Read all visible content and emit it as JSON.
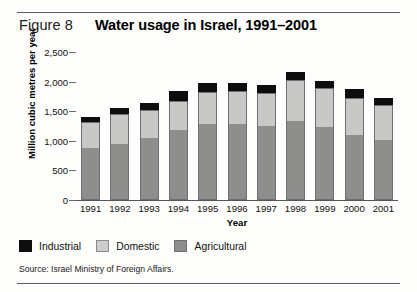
{
  "figure": {
    "number_label": "Figure 8",
    "title": "Water usage in Israel, 1991–2001",
    "source": "Source: Israel Ministry  of Foreign Affairs."
  },
  "legend": {
    "items": [
      {
        "label": "Industrial",
        "color": "#0d0d0d",
        "key": "industrial"
      },
      {
        "label": "Domestic",
        "color": "#cdcdcb",
        "key": "domestic"
      },
      {
        "label": "Agricultural",
        "color": "#8e8e8c",
        "key": "agricultural"
      }
    ]
  },
  "chart_data": {
    "type": "bar",
    "stacked": true,
    "title": "Water usage in Israel, 1991–2001",
    "xlabel": "Year",
    "ylabel": "Million cubic metres per year",
    "categories": [
      "1991",
      "1992",
      "1993",
      "1994",
      "1995",
      "1996",
      "1997",
      "1998",
      "1999",
      "2000",
      "2001"
    ],
    "ytick_labels": [
      "0",
      "500",
      "1,000",
      "1,500",
      "2,000",
      "2,500"
    ],
    "ytick_values": [
      0,
      500,
      1000,
      1500,
      2000,
      2500
    ],
    "ylim": [
      0,
      2500
    ],
    "grid": false,
    "legend_position": "below-plot",
    "series": [
      {
        "name": "Agricultural",
        "color": "#8e8e8c",
        "values": [
          880,
          940,
          1040,
          1180,
          1280,
          1280,
          1250,
          1330,
          1240,
          1100,
          1010
        ]
      },
      {
        "name": "Domestic",
        "color": "#c8c8c6",
        "values": [
          440,
          510,
          480,
          490,
          540,
          560,
          560,
          690,
          650,
          620,
          600
        ]
      },
      {
        "name": "Industrial",
        "color": "#0d0d0d",
        "values": [
          90,
          110,
          120,
          170,
          150,
          140,
          140,
          140,
          120,
          150,
          120
        ]
      }
    ],
    "totals": [
      1410,
      1560,
      1640,
      1840,
      1970,
      1980,
      1950,
      2160,
      2010,
      1870,
      1730
    ]
  }
}
